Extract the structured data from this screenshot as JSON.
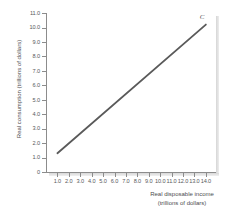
{
  "figure": {
    "cropped_caption": "",
    "background_color": "#ffffff"
  },
  "axes": {
    "y_title": "Real consumption (trillions of dollars)",
    "x_title_line1": "Real disposable income",
    "x_title_line2": "(trillions of dollars)",
    "axis_color": "#8c8c8c",
    "tick_label_color": "#58595b"
  },
  "chart_data": {
    "type": "line",
    "title": "",
    "xlabel": "Real disposable income (trillions of dollars)",
    "ylabel": "Real consumption (trillions of dollars)",
    "xlim": [
      0,
      14.8
    ],
    "ylim": [
      0,
      11.0
    ],
    "grid": false,
    "legend_position": "none",
    "x_ticks": [
      1.0,
      2.0,
      3.0,
      4.0,
      5.0,
      6.0,
      7.0,
      8.0,
      9.0,
      10.0,
      11.0,
      12.0,
      13.0,
      14.0
    ],
    "x_tick_labels": [
      "1.0",
      "2.0",
      "3.0",
      "4.0",
      "5.0",
      "6.0",
      "7.0",
      "8.0",
      "9.0",
      "10.0",
      "11.0",
      "12.0",
      "13.0",
      "14.0"
    ],
    "y_ticks": [
      0,
      1.0,
      2.0,
      3.0,
      4.0,
      5.0,
      6.0,
      7.0,
      8.0,
      9.0,
      10.0,
      11.0
    ],
    "y_tick_labels": [
      "0",
      "1.0",
      "2.0",
      "3.0",
      "4.0",
      "5.0",
      "6.0",
      "7.0",
      "8.0",
      "9.0",
      "10.0",
      "11.0"
    ],
    "series": [
      {
        "name": "C",
        "annotation": "C",
        "color": "#5a5a5a",
        "line_width": 1.8,
        "x": [
          1.0,
          14.0
        ],
        "values": [
          1.3,
          10.2
        ],
        "slope": 0.685,
        "intercept": 0.615
      }
    ]
  }
}
